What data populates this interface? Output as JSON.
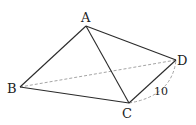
{
  "diagram": {
    "type": "geometry-figure",
    "vertices": [
      {
        "id": "A",
        "label": "A"
      },
      {
        "id": "B",
        "label": "B"
      },
      {
        "id": "C",
        "label": "C"
      },
      {
        "id": "D",
        "label": "D"
      }
    ],
    "solid_edges": [
      [
        "A",
        "B"
      ],
      [
        "A",
        "C"
      ],
      [
        "A",
        "D"
      ],
      [
        "B",
        "C"
      ],
      [
        "C",
        "D"
      ]
    ],
    "dashed_edges": [
      [
        "B",
        "D"
      ]
    ],
    "dimension": {
      "between": [
        "C",
        "D"
      ],
      "value": "10",
      "style": "dashed-arc"
    }
  }
}
